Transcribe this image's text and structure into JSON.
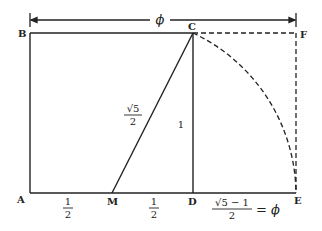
{
  "diagram": {
    "points": {
      "A": "A",
      "B": "B",
      "C": "C",
      "D": "D",
      "E": "E",
      "F": "F",
      "M": "M"
    },
    "dimension": {
      "top_label": "ϕ"
    },
    "segment_labels": {
      "AM_num": "1",
      "AM_den": "2",
      "MD_num": "1",
      "MD_den": "2",
      "MC_num": "√5",
      "MC_den": "2",
      "CD": "1",
      "DE_num": "√5 − 1",
      "DE_den": "2",
      "DE_eq": "= ϕ"
    },
    "colors": {
      "line": "#222222",
      "background": "#ffffff"
    }
  }
}
